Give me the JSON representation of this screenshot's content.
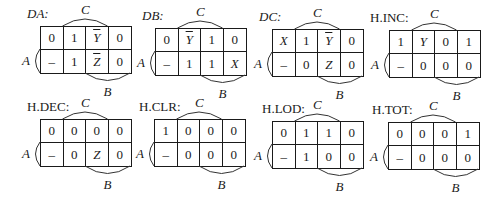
{
  "figure": {
    "variable_labels": {
      "top": "C",
      "left": "A",
      "bottom": "B"
    },
    "maps": [
      {
        "name": "DA",
        "title": "DA:",
        "title_italic": true,
        "x": 40,
        "y": 26,
        "title_x": 27,
        "title_y": 6,
        "cells": [
          [
            "0",
            "1",
            "Ȳ",
            "0"
          ],
          [
            "–",
            "1",
            "Z̄",
            "0"
          ]
        ],
        "overline": [
          [
            false,
            false,
            true,
            false
          ],
          [
            false,
            false,
            true,
            false
          ]
        ],
        "italic": [
          [
            false,
            false,
            true,
            false
          ],
          [
            false,
            false,
            true,
            false
          ]
        ],
        "display": [
          [
            "0",
            "1",
            "Y",
            "0"
          ],
          [
            "–",
            "1",
            "Z",
            "0"
          ]
        ]
      },
      {
        "name": "DB",
        "title": "DB:",
        "title_italic": true,
        "x": 155,
        "y": 28,
        "title_x": 142,
        "title_y": 8,
        "cells": [
          [
            "0",
            "Ȳ",
            "1",
            "0"
          ],
          [
            "–",
            "1",
            "1",
            "X"
          ]
        ],
        "overline": [
          [
            false,
            true,
            false,
            false
          ],
          [
            false,
            false,
            false,
            false
          ]
        ],
        "italic": [
          [
            false,
            true,
            false,
            false
          ],
          [
            false,
            false,
            false,
            true
          ]
        ],
        "display": [
          [
            "0",
            "Y",
            "1",
            "0"
          ],
          [
            "–",
            "1",
            "1",
            "X"
          ]
        ]
      },
      {
        "name": "DC",
        "title": "DC:",
        "title_italic": true,
        "x": 272,
        "y": 29,
        "title_x": 259,
        "title_y": 9,
        "cells": [
          [
            "X",
            "1",
            "Ȳ",
            "0"
          ],
          [
            "–",
            "0",
            "Z",
            "0"
          ]
        ],
        "overline": [
          [
            false,
            false,
            true,
            false
          ],
          [
            false,
            false,
            false,
            false
          ]
        ],
        "italic": [
          [
            true,
            false,
            true,
            false
          ],
          [
            false,
            false,
            true,
            false
          ]
        ],
        "display": [
          [
            "X",
            "1",
            "Y",
            "0"
          ],
          [
            "–",
            "0",
            "Z",
            "0"
          ]
        ]
      },
      {
        "name": "H.INC",
        "title": "H.INC:",
        "title_italic": false,
        "x": 389,
        "y": 30,
        "title_x": 370,
        "title_y": 10,
        "cells": [
          [
            "1",
            "Y",
            "0",
            "1"
          ],
          [
            "–",
            "0",
            "0",
            "0"
          ]
        ],
        "overline": [
          [
            false,
            false,
            false,
            false
          ],
          [
            false,
            false,
            false,
            false
          ]
        ],
        "italic": [
          [
            false,
            true,
            false,
            false
          ],
          [
            false,
            false,
            false,
            false
          ]
        ],
        "display": [
          [
            "1",
            "Y",
            "0",
            "1"
          ],
          [
            "–",
            "0",
            "0",
            "0"
          ]
        ]
      },
      {
        "name": "H.DEC",
        "title": "H.DEC:",
        "title_italic": false,
        "x": 40,
        "y": 119,
        "title_x": 27,
        "title_y": 99,
        "cells": [
          [
            "0",
            "0",
            "0",
            "0"
          ],
          [
            "–",
            "0",
            "Z",
            "0"
          ]
        ],
        "overline": [
          [
            false,
            false,
            false,
            false
          ],
          [
            false,
            false,
            false,
            false
          ]
        ],
        "italic": [
          [
            false,
            false,
            false,
            false
          ],
          [
            false,
            false,
            true,
            false
          ]
        ],
        "display": [
          [
            "0",
            "0",
            "0",
            "0"
          ],
          [
            "–",
            "0",
            "Z",
            "0"
          ]
        ]
      },
      {
        "name": "H.CLR",
        "title": "H.CLR:",
        "title_italic": false,
        "x": 154,
        "y": 119,
        "title_x": 139,
        "title_y": 99,
        "cells": [
          [
            "1",
            "0",
            "0",
            "0"
          ],
          [
            "–",
            "0",
            "0",
            "0"
          ]
        ],
        "overline": [
          [
            false,
            false,
            false,
            false
          ],
          [
            false,
            false,
            false,
            false
          ]
        ],
        "italic": [
          [
            false,
            false,
            false,
            false
          ],
          [
            false,
            false,
            false,
            false
          ]
        ],
        "display": [
          [
            "1",
            "0",
            "0",
            "0"
          ],
          [
            "–",
            "0",
            "0",
            "0"
          ]
        ]
      },
      {
        "name": "H.LOD",
        "title": "H.LOD:",
        "title_italic": false,
        "x": 272,
        "y": 121,
        "title_x": 262,
        "title_y": 101,
        "cells": [
          [
            "0",
            "1",
            "1",
            "0"
          ],
          [
            "–",
            "1",
            "0",
            "0"
          ]
        ],
        "overline": [
          [
            false,
            false,
            false,
            false
          ],
          [
            false,
            false,
            false,
            false
          ]
        ],
        "italic": [
          [
            false,
            false,
            false,
            false
          ],
          [
            false,
            false,
            false,
            false
          ]
        ],
        "display": [
          [
            "0",
            "1",
            "1",
            "0"
          ],
          [
            "–",
            "1",
            "0",
            "0"
          ]
        ]
      },
      {
        "name": "H.TOT",
        "title": "H.TOT:",
        "title_italic": false,
        "x": 388,
        "y": 122,
        "title_x": 372,
        "title_y": 102,
        "cells": [
          [
            "0",
            "0",
            "0",
            "1"
          ],
          [
            "–",
            "0",
            "0",
            "0"
          ]
        ],
        "overline": [
          [
            false,
            false,
            false,
            false
          ],
          [
            false,
            false,
            false,
            false
          ]
        ],
        "italic": [
          [
            false,
            false,
            false,
            false
          ],
          [
            false,
            false,
            false,
            false
          ]
        ],
        "display": [
          [
            "0",
            "0",
            "0",
            "1"
          ],
          [
            "–",
            "0",
            "0",
            "0"
          ]
        ]
      }
    ]
  }
}
